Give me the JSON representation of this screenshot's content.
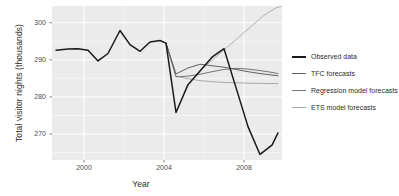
{
  "chart_data": {
    "type": "line",
    "title": "",
    "xlabel": "Year",
    "ylabel": "Total visitor nights (thousands)",
    "xlim": [
      1998.4,
      2009.9
    ],
    "ylim": [
      263.0,
      304.5
    ],
    "xticks": [
      2000,
      2004,
      2008
    ],
    "xtick_labels": [
      "2000",
      "2004",
      "2008"
    ],
    "yticks": [
      270,
      280,
      290,
      300
    ],
    "ytick_labels": [
      "270",
      "280",
      "290",
      "300"
    ],
    "grid": true,
    "legend_position": "right",
    "panel_background": "#ebebeb",
    "grid_color": "#ffffff",
    "series": [
      {
        "name": "Observed data",
        "color": "#1a1a1a",
        "width": 1.5,
        "x": [
          1998.6,
          1999.2,
          1999.7,
          2000.2,
          2000.7,
          2001.2,
          2001.8,
          2002.3,
          2002.8,
          2003.3,
          2003.8,
          2004.1,
          2004.6,
          2005.2,
          2005.8,
          2006.4,
          2007.0,
          2007.6,
          2008.2,
          2008.8,
          2009.4,
          2009.7
        ],
        "y": [
          292.6,
          292.9,
          293.0,
          292.6,
          289.7,
          291.7,
          297.9,
          294.1,
          292.3,
          294.8,
          295.2,
          294.5,
          275.8,
          283.3,
          287.0,
          290.7,
          293.0,
          282.5,
          272.0,
          264.5,
          267.0,
          270.3
        ]
      },
      {
        "name": "TFC forecasts",
        "color": "#606060",
        "width": 1.0,
        "x": [
          2004.1,
          2004.6,
          2005.2,
          2005.8,
          2006.4,
          2007.0,
          2007.6,
          2008.2,
          2008.8,
          2009.4,
          2009.7
        ],
        "y": [
          294.5,
          286.2,
          287.8,
          288.8,
          288.4,
          288.0,
          287.4,
          286.8,
          286.3,
          285.9,
          285.7
        ]
      },
      {
        "name": "Regression model forecasts",
        "color": "#757575",
        "width": 1.0,
        "x": [
          2004.1,
          2004.6,
          2005.2,
          2005.8,
          2006.4,
          2007.0,
          2007.6,
          2008.2,
          2008.8,
          2009.4,
          2009.7
        ],
        "y": [
          294.5,
          285.4,
          285.6,
          286.1,
          286.8,
          287.4,
          287.7,
          287.5,
          287.1,
          286.6,
          286.3
        ]
      },
      {
        "name": "ETS model forecasts",
        "color": "#a8a8a8",
        "width": 1.0,
        "x": [
          2004.1,
          2004.6,
          2005.2,
          2005.8,
          2006.4,
          2007.0,
          2007.6,
          2008.2,
          2008.8,
          2009.4,
          2009.7
        ],
        "y": [
          294.5,
          285.6,
          284.9,
          284.4,
          284.1,
          283.9,
          283.8,
          283.7,
          283.65,
          283.6,
          283.6
        ]
      },
      {
        "name": "ETS model forecasts upper",
        "color": "#b0b0b0",
        "width": 1.0,
        "x": [
          2006.0,
          2006.6,
          2007.2,
          2007.8,
          2008.4,
          2009.0,
          2009.6,
          2009.85
        ],
        "y": [
          288.0,
          290.8,
          293.6,
          296.4,
          299.2,
          302.0,
          304.0,
          304.4
        ]
      }
    ]
  },
  "legend": {
    "entries": [
      {
        "label": "Observed data",
        "color": "#1a1a1a",
        "width": 2.0
      },
      {
        "label": "TFC forecasts",
        "color": "#606060",
        "width": 1.2
      },
      {
        "label": "Regression model forecasts",
        "color": "#757575",
        "width": 1.2
      },
      {
        "label": "ETS model forecasts",
        "color": "#a8a8a8",
        "width": 1.4
      }
    ]
  }
}
